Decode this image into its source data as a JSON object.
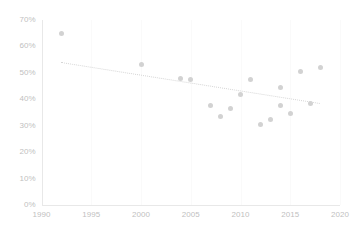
{
  "chart_data": {
    "type": "scatter",
    "title": "",
    "xlabel": "",
    "ylabel": "",
    "xlim": [
      1990,
      2020
    ],
    "ylim": [
      0,
      0.7
    ],
    "grid": false,
    "legend": null,
    "y_tick_labels": [
      "0%",
      "10%",
      "20%",
      "30%",
      "40%",
      "50%",
      "60%",
      "70%"
    ],
    "y_tick_values": [
      0,
      0.1,
      0.2,
      0.3,
      0.4,
      0.5,
      0.6,
      0.7
    ],
    "x_tick_labels": [
      "1990",
      "1995",
      "2000",
      "2005",
      "2010",
      "2015",
      "2020"
    ],
    "x_tick_values": [
      1990,
      1995,
      2000,
      2005,
      2010,
      2015,
      2020
    ],
    "series": [
      {
        "name": "observations",
        "marker": "circle",
        "color": "#d2d2d2",
        "points": [
          {
            "x": 1992,
            "y": 0.65
          },
          {
            "x": 2000,
            "y": 0.53
          },
          {
            "x": 2004,
            "y": 0.48
          },
          {
            "x": 2005,
            "y": 0.475
          },
          {
            "x": 2007,
            "y": 0.375
          },
          {
            "x": 2008,
            "y": 0.335
          },
          {
            "x": 2009,
            "y": 0.365
          },
          {
            "x": 2010,
            "y": 0.42
          },
          {
            "x": 2011,
            "y": 0.475
          },
          {
            "x": 2012,
            "y": 0.305
          },
          {
            "x": 2013,
            "y": 0.325
          },
          {
            "x": 2014,
            "y": 0.445
          },
          {
            "x": 2014,
            "y": 0.375
          },
          {
            "x": 2015,
            "y": 0.345
          },
          {
            "x": 2016,
            "y": 0.505
          },
          {
            "x": 2017,
            "y": 0.385
          },
          {
            "x": 2018,
            "y": 0.52
          }
        ]
      }
    ],
    "trendline": {
      "name": "linear-trend",
      "style": "dotted",
      "color": "#d6d6d6",
      "x_start": 1992,
      "y_start": 0.54,
      "x_end": 2018,
      "y_end": 0.385
    }
  }
}
